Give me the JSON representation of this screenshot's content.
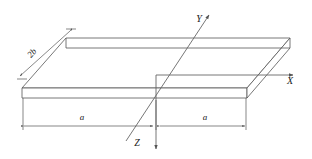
{
  "figure": {
    "type": "isometric-plate-with-axes",
    "background_color": "#ffffff",
    "line_color": "#555555",
    "axis_color": "#666666",
    "text_color": "#1a1a1a"
  },
  "axes": {
    "origin": {
      "x": 156,
      "y": 75
    },
    "items": [
      {
        "name": "Y",
        "label": "Y",
        "label_x": 199,
        "label_y": 22,
        "from_x": 126,
        "from_y": 141,
        "to_x": 212,
        "to_y": 12,
        "direction": "up-right"
      },
      {
        "name": "X",
        "label": "X",
        "label_x": 290,
        "label_y": 84,
        "from_x": 156,
        "from_y": 75,
        "to_x": 296,
        "to_y": 75,
        "direction": "right"
      },
      {
        "name": "Z",
        "label": "Z",
        "label_x": 137,
        "label_y": 146,
        "from_x": 156,
        "from_y": 75,
        "to_x": 156,
        "to_y": 152,
        "direction": "down"
      }
    ]
  },
  "plate": {
    "top_face": {
      "front_left_x": 22,
      "front_left_y": 88,
      "front_right_x": 247,
      "front_right_y": 88,
      "back_right_x": 290,
      "back_right_y": 38,
      "back_left_x": 66,
      "back_left_y": 38
    },
    "thickness_px": 10
  },
  "dimensions": [
    {
      "name": "width-left",
      "label": "a",
      "label_x": 82,
      "label_y": 120,
      "line_y": 126,
      "from_x": 24,
      "to_x": 153
    },
    {
      "name": "width-right",
      "label": "a",
      "label_x": 205,
      "label_y": 120,
      "line_y": 126,
      "from_x": 160,
      "to_x": 245
    },
    {
      "name": "depth",
      "label": "2b",
      "label_x": 34,
      "label_y": 55,
      "label_rotation": -48,
      "from_x": 70,
      "from_y": 31,
      "to_x": 20,
      "to_y": 76
    }
  ]
}
